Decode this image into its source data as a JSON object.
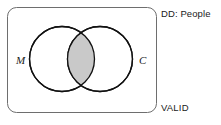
{
  "diagram": {
    "type": "venn-two-set",
    "title_label": "DD: People",
    "status_label": "VALID",
    "universe": {
      "name": "domain-of-discourse-box",
      "shape": "rounded-rectangle",
      "x": 7,
      "y": 7,
      "width": 150,
      "height": 106,
      "corner_radius": 9,
      "stroke_color": "#6e6e6e",
      "stroke_width": 1,
      "fill_color": "#ffffff"
    },
    "sets": [
      {
        "id": "M",
        "label": "M",
        "name": "set-m-circle",
        "cx": 62,
        "cy": 59,
        "r": 32.5,
        "stroke_color": "#111111",
        "stroke_width": 1.3,
        "fill_color": "#ffffff",
        "label_x": 16,
        "label_y": 55
      },
      {
        "id": "C",
        "label": "C",
        "name": "set-c-circle",
        "cx": 100,
        "cy": 59,
        "r": 32.5,
        "stroke_color": "#111111",
        "stroke_width": 1.3,
        "fill_color": "#ffffff",
        "label_x": 139,
        "label_y": 55
      }
    ],
    "intersection": {
      "name": "intersection-lens",
      "shaded": true,
      "fill_color": "#c9c9c9",
      "stroke_color": "#111111",
      "stroke_width": 1.3,
      "description": "M and C overlap region shaded"
    },
    "colors": {
      "background": "#ffffff",
      "box_stroke": "#6e6e6e",
      "circle_stroke": "#111111",
      "shade_fill": "#c9c9c9",
      "text": "#1a1a1a"
    }
  }
}
